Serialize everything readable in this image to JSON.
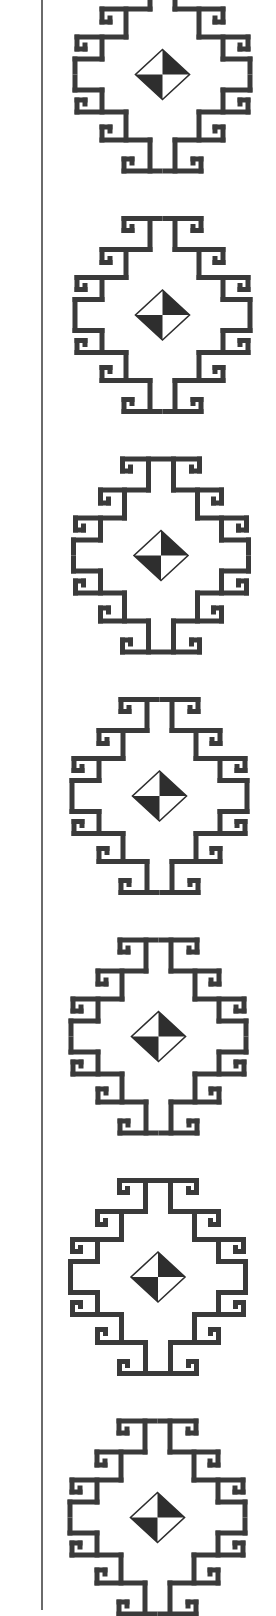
{
  "artwork": {
    "description": "Vertical border strip of repeated stepped-meander diamond motifs",
    "motif_count": 7,
    "colors": {
      "ink": "#3a3a3a",
      "rule": "#6a6a6a",
      "background": "#ffffff"
    },
    "icons": {
      "motif": "stepped-meander-diamond-icon",
      "center": "quartered-diamond-icon"
    }
  }
}
